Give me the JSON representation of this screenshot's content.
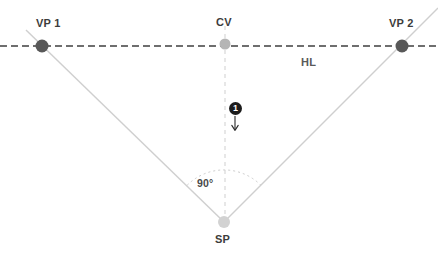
{
  "canvas": {
    "width": 438,
    "height": 257,
    "background": "#ffffff"
  },
  "colors": {
    "horizon_line": "#3f3f3f",
    "vanishing_point_dot": "#585858",
    "center_vision_dot": "#b5b5b5",
    "station_point_dot": "#d2d2d2",
    "sight_line": "#cfcfcf",
    "vertical_dashed": "#d8d8d8",
    "angle_arc": "#cbcbcb",
    "label_text": "#3c3c3c",
    "badge_fill": "#1c1c1c",
    "badge_text": "#ffffff",
    "arrow": "#2b2b2b"
  },
  "labels": {
    "vp1": "VP 1",
    "cv": "CV",
    "vp2": "VP 2",
    "horizon": "HL",
    "angle": "90°",
    "sp": "SP"
  },
  "annotations": {
    "step_badge": "1"
  },
  "chart_data": {
    "type": "diagram",
    "points": [
      {
        "id": "vp1",
        "label": "VP 1",
        "x": 42,
        "y": 46,
        "radius": 6.5,
        "fill": "#585858",
        "label_dx": -4,
        "label_dy": -26
      },
      {
        "id": "cv",
        "label": "CV",
        "x": 225,
        "y": 44,
        "radius": 5.5,
        "fill": "#b5b5b5",
        "label_dx": -8,
        "label_dy": -26
      },
      {
        "id": "vp2",
        "label": "VP 2",
        "x": 402,
        "y": 46,
        "radius": 6.5,
        "fill": "#585858",
        "label_dx": -10,
        "label_dy": -26
      },
      {
        "id": "sp",
        "label": "SP",
        "x": 224,
        "y": 222,
        "radius": 6.0,
        "fill": "#d2d2d2",
        "label_dx": -9,
        "label_dy": 14
      }
    ],
    "lines": [
      {
        "id": "horizon-line",
        "label": "HL",
        "style": "dashed",
        "x1": 0,
        "y1": 46,
        "x2": 438,
        "y2": 46,
        "color": "#3f3f3f",
        "width": 1.6,
        "dash": "7 4"
      },
      {
        "id": "sight-line-left",
        "style": "solid",
        "x1": 26,
        "y1": 30,
        "x2": 224,
        "y2": 222,
        "color": "#cfcfcf",
        "width": 1.4
      },
      {
        "id": "sight-line-right",
        "style": "solid",
        "x1": 224,
        "y1": 222,
        "x2": 438,
        "y2": 8,
        "color": "#cfcfcf",
        "width": 1.4
      },
      {
        "id": "center-vertical",
        "style": "dashed",
        "x1": 225,
        "y1": 26,
        "x2": 225,
        "y2": 222,
        "color": "#d8d8d8",
        "width": 1.2,
        "dash": "4 4"
      }
    ],
    "arcs": [
      {
        "id": "angle-arc",
        "label": "90°",
        "center_x": 224,
        "center_y": 222,
        "radius": 52,
        "start_angle_deg": 135,
        "end_angle_deg": 45,
        "color": "#cbcbcb"
      }
    ],
    "arrow": {
      "id": "direction-arrow",
      "label": "1",
      "x": 235,
      "y1": 117,
      "y2": 130,
      "direction": "down",
      "color": "#2b2b2b"
    },
    "text_labels": [
      {
        "id": "hl-label",
        "text": "HL",
        "x": 300,
        "y": 58
      },
      {
        "id": "angle-label",
        "text": "90°",
        "x": 197,
        "y": 178
      }
    ]
  }
}
